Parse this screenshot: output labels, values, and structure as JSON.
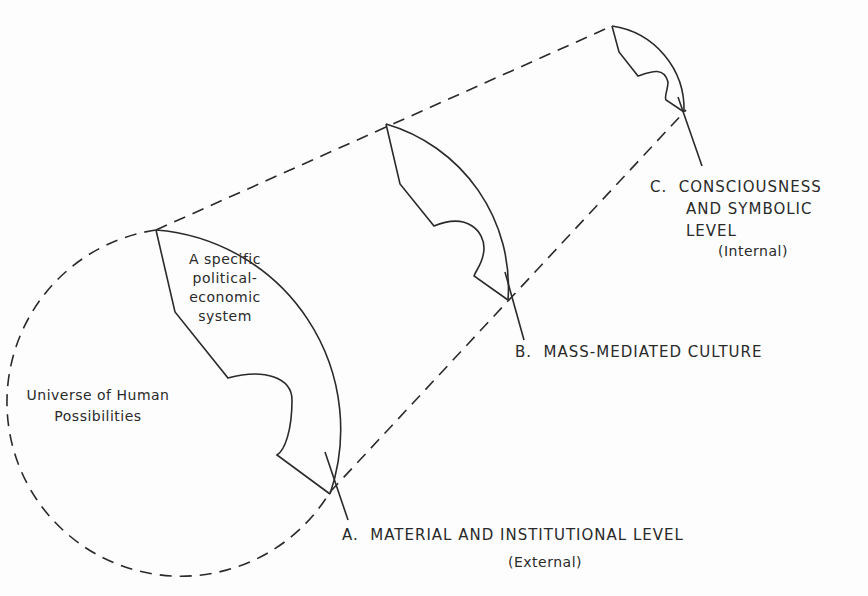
{
  "diagram": {
    "type": "cone-of-levels",
    "inner_labels": {
      "system": [
        "A specific",
        "political-",
        "economic",
        "system"
      ],
      "universe": [
        "Universe of Human",
        "Possibilities"
      ]
    },
    "levels": [
      {
        "letter": "A.",
        "title": "MATERIAL AND INSTITUTIONAL LEVEL",
        "qualifier": "(External)"
      },
      {
        "letter": "B.",
        "title": "MASS-MEDIATED CULTURE"
      },
      {
        "letter": "C.",
        "title_lines": [
          "CONSCIOUSNESS",
          "AND SYMBOLIC",
          "LEVEL"
        ],
        "qualifier": "(Internal)"
      }
    ],
    "colors": {
      "ink": "#2a2a2a",
      "background": "#fdfdfd"
    }
  }
}
